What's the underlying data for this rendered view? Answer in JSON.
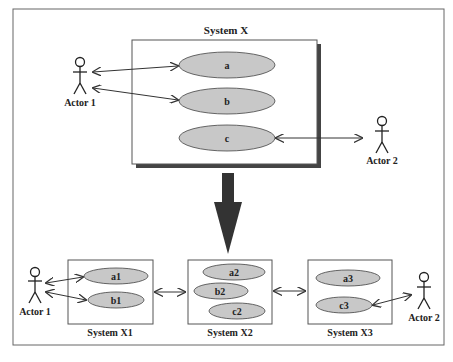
{
  "colors": {
    "usecase_fill": "#c8c8c8",
    "stroke": "#333333",
    "frame": "#555555",
    "big_arrow": "#333333",
    "shadow": "#444444"
  },
  "top": {
    "system_title": "System X",
    "usecases": [
      "a",
      "b",
      "c"
    ],
    "actor_left": "Actor 1",
    "actor_right": "Actor 2"
  },
  "bottom": {
    "actor_left": "Actor 1",
    "actor_right": "Actor 2",
    "systems": [
      {
        "title": "System X1",
        "usecases": [
          "a1",
          "b1"
        ]
      },
      {
        "title": "System X2",
        "usecases": [
          "a2",
          "b2",
          "c2"
        ]
      },
      {
        "title": "System X3",
        "usecases": [
          "a3",
          "c3"
        ]
      }
    ]
  }
}
